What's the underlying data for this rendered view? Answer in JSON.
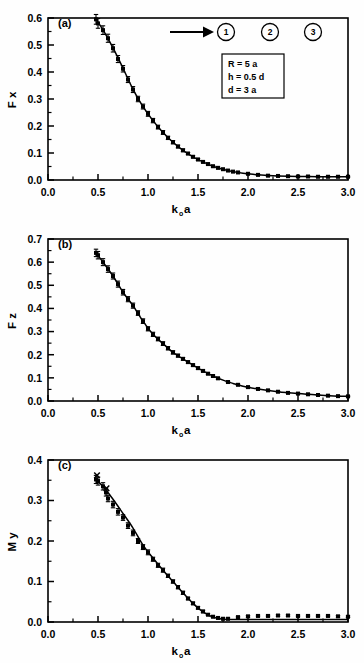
{
  "figure": {
    "background_color": "#fefefe",
    "line_color": "#000000",
    "marker_color": "#000000"
  },
  "annotations": {
    "arrow_label": "incident-arrow",
    "circled_numbers": [
      "1",
      "2",
      "3"
    ],
    "param_box": {
      "lines": [
        "R = 5 a",
        "h = 0.5 d",
        "d = 3 a"
      ]
    }
  },
  "axis_common": {
    "xlabel_main": "k",
    "xlabel_sub": "o",
    "xlabel_tail": "a",
    "xticks": [
      "0.0",
      "0.5",
      "1.0",
      "1.5",
      "2.0",
      "2.5",
      "3.0"
    ],
    "xlim": [
      0.0,
      3.0
    ]
  },
  "chart_data": [
    {
      "type": "scatter",
      "panel": "(a)",
      "title": "",
      "xlabel": "k o a",
      "ylabel": "F x",
      "xlim": [
        0.0,
        3.0
      ],
      "ylim": [
        0.0,
        0.6
      ],
      "xticks": [
        "0.0",
        "0.5",
        "1.0",
        "1.5",
        "2.0",
        "2.5",
        "3.0"
      ],
      "yticks": [
        "0.0",
        "0.1",
        "0.2",
        "0.3",
        "0.4",
        "0.5",
        "0.6"
      ],
      "grid": false,
      "legend": "none",
      "x": [
        0.48,
        0.5,
        0.55,
        0.6,
        0.65,
        0.7,
        0.75,
        0.8,
        0.85,
        0.9,
        0.95,
        1.0,
        1.05,
        1.1,
        1.15,
        1.2,
        1.25,
        1.3,
        1.35,
        1.4,
        1.45,
        1.5,
        1.55,
        1.6,
        1.65,
        1.7,
        1.75,
        1.8,
        1.85,
        1.9,
        2.0,
        2.1,
        2.2,
        2.3,
        2.4,
        2.5,
        2.6,
        2.7,
        2.8,
        2.9,
        3.0
      ],
      "y": [
        0.595,
        0.58,
        0.555,
        0.525,
        0.488,
        0.448,
        0.412,
        0.372,
        0.335,
        0.3,
        0.272,
        0.245,
        0.22,
        0.196,
        0.176,
        0.156,
        0.14,
        0.124,
        0.11,
        0.098,
        0.086,
        0.076,
        0.067,
        0.059,
        0.051,
        0.045,
        0.04,
        0.035,
        0.031,
        0.028,
        0.023,
        0.019,
        0.016,
        0.015,
        0.014,
        0.013,
        0.013,
        0.012,
        0.012,
        0.012,
        0.012
      ],
      "yerr": [
        0.018,
        0.018,
        0.016,
        0.015,
        0.014,
        0.013,
        0.012,
        0.011,
        0.011,
        0.01,
        0.009,
        0.009,
        0.008,
        0.007,
        0.007,
        0.006,
        0.006,
        0.005,
        0.005,
        0.004,
        0.004,
        0.004,
        0.003,
        0.003,
        0.003,
        0.003,
        0.002,
        0.002,
        0.002,
        0.002,
        0.002,
        0.002,
        0.002,
        0.002,
        0.002,
        0.002,
        0.002,
        0.002,
        0.002,
        0.002,
        0.002
      ],
      "line_x": [
        0.47,
        0.55,
        0.65,
        0.75,
        0.85,
        0.95,
        1.05,
        1.15,
        1.25,
        1.35,
        1.45,
        1.55,
        1.65,
        1.75,
        1.85,
        1.95,
        2.05,
        2.2,
        2.4,
        2.6,
        2.8,
        3.0
      ],
      "line_y": [
        0.6,
        0.556,
        0.489,
        0.414,
        0.336,
        0.272,
        0.22,
        0.176,
        0.14,
        0.11,
        0.086,
        0.067,
        0.051,
        0.04,
        0.031,
        0.025,
        0.021,
        0.017,
        0.014,
        0.013,
        0.012,
        0.012
      ]
    },
    {
      "type": "scatter",
      "panel": "(b)",
      "title": "",
      "xlabel": "k o a",
      "ylabel": "F z",
      "xlim": [
        0.0,
        3.0
      ],
      "ylim": [
        0.0,
        0.7
      ],
      "xticks": [
        "0.0",
        "0.5",
        "1.0",
        "1.5",
        "2.0",
        "2.5",
        "3.0"
      ],
      "yticks": [
        "0.0",
        "0.1",
        "0.2",
        "0.3",
        "0.4",
        "0.5",
        "0.6",
        "0.7"
      ],
      "grid": false,
      "legend": "none",
      "x": [
        0.48,
        0.5,
        0.55,
        0.6,
        0.65,
        0.7,
        0.75,
        0.8,
        0.85,
        0.9,
        0.95,
        1.0,
        1.05,
        1.1,
        1.15,
        1.2,
        1.25,
        1.3,
        1.35,
        1.4,
        1.45,
        1.5,
        1.55,
        1.6,
        1.65,
        1.7,
        1.8,
        1.9,
        2.0,
        2.1,
        2.2,
        2.3,
        2.4,
        2.5,
        2.6,
        2.7,
        2.8,
        2.9,
        3.0
      ],
      "y": [
        0.64,
        0.63,
        0.6,
        0.57,
        0.54,
        0.505,
        0.47,
        0.44,
        0.412,
        0.38,
        0.345,
        0.312,
        0.288,
        0.268,
        0.248,
        0.228,
        0.21,
        0.196,
        0.182,
        0.168,
        0.155,
        0.142,
        0.13,
        0.118,
        0.108,
        0.098,
        0.082,
        0.07,
        0.06,
        0.052,
        0.046,
        0.04,
        0.035,
        0.032,
        0.029,
        0.026,
        0.023,
        0.021,
        0.02
      ],
      "yerr": [
        0.016,
        0.016,
        0.015,
        0.014,
        0.013,
        0.013,
        0.012,
        0.011,
        0.011,
        0.01,
        0.01,
        0.009,
        0.009,
        0.008,
        0.008,
        0.007,
        0.007,
        0.006,
        0.006,
        0.005,
        0.005,
        0.005,
        0.004,
        0.004,
        0.004,
        0.004,
        0.003,
        0.003,
        0.003,
        0.003,
        0.002,
        0.002,
        0.002,
        0.002,
        0.002,
        0.002,
        0.002,
        0.002,
        0.002
      ],
      "line_x": [
        0.47,
        0.55,
        0.65,
        0.75,
        0.85,
        0.95,
        1.05,
        1.15,
        1.25,
        1.35,
        1.45,
        1.55,
        1.65,
        1.75,
        1.85,
        1.95,
        2.1,
        2.3,
        2.5,
        2.7,
        2.9,
        3.0
      ],
      "line_y": [
        0.645,
        0.6,
        0.54,
        0.47,
        0.412,
        0.345,
        0.288,
        0.248,
        0.21,
        0.182,
        0.155,
        0.13,
        0.108,
        0.09,
        0.076,
        0.064,
        0.052,
        0.04,
        0.032,
        0.026,
        0.021,
        0.02
      ]
    },
    {
      "type": "scatter",
      "panel": "(c)",
      "title": "",
      "xlabel": "k o a",
      "ylabel": "M y",
      "xlim": [
        0.0,
        3.0
      ],
      "ylim": [
        0.0,
        0.4
      ],
      "xticks": [
        "0.0",
        "0.5",
        "1.0",
        "1.5",
        "2.0",
        "2.5",
        "3.0"
      ],
      "yticks": [
        "0.0",
        "0.1",
        "0.2",
        "0.3",
        "0.4"
      ],
      "grid": false,
      "legend": "none",
      "x": [
        0.48,
        0.5,
        0.55,
        0.58,
        0.6,
        0.65,
        0.7,
        0.75,
        0.8,
        0.85,
        0.9,
        0.95,
        1.0,
        1.05,
        1.1,
        1.15,
        1.2,
        1.25,
        1.3,
        1.35,
        1.4,
        1.45,
        1.5,
        1.55,
        1.6,
        1.65,
        1.7,
        1.75,
        1.8,
        1.9,
        2.0,
        2.1,
        2.2,
        2.3,
        2.4,
        2.5,
        2.6,
        2.7,
        2.8,
        2.9,
        3.0
      ],
      "y": [
        0.352,
        0.348,
        0.335,
        0.32,
        0.305,
        0.29,
        0.272,
        0.258,
        0.238,
        0.22,
        0.2,
        0.185,
        0.172,
        0.155,
        0.14,
        0.128,
        0.114,
        0.1,
        0.086,
        0.072,
        0.058,
        0.046,
        0.035,
        0.026,
        0.018,
        0.013,
        0.01,
        0.008,
        0.008,
        0.012,
        0.014,
        0.015,
        0.015,
        0.016,
        0.016,
        0.015,
        0.015,
        0.015,
        0.015,
        0.014,
        0.013
      ],
      "yerr": [
        0.01,
        0.01,
        0.009,
        0.009,
        0.008,
        0.008,
        0.008,
        0.007,
        0.007,
        0.007,
        0.006,
        0.006,
        0.006,
        0.005,
        0.005,
        0.005,
        0.004,
        0.004,
        0.004,
        0.004,
        0.003,
        0.003,
        0.003,
        0.003,
        0.002,
        0.002,
        0.002,
        0.002,
        0.002,
        0.002,
        0.002,
        0.002,
        0.002,
        0.002,
        0.002,
        0.002,
        0.002,
        0.002,
        0.002,
        0.002,
        0.002
      ],
      "outliers_x": [
        0.49,
        0.585
      ],
      "outliers_y": [
        0.362,
        0.33
      ],
      "line_x": [
        0.47,
        0.55,
        0.65,
        0.75,
        0.85,
        0.95,
        1.05,
        1.15,
        1.25,
        1.35,
        1.45,
        1.55,
        1.65,
        1.75,
        1.85,
        2.0,
        2.2,
        2.5,
        2.8,
        3.0
      ],
      "line_y": [
        0.352,
        0.335,
        0.303,
        0.268,
        0.232,
        0.19,
        0.158,
        0.128,
        0.1,
        0.072,
        0.046,
        0.025,
        0.012,
        0.007,
        0.006,
        0.006,
        0.006,
        0.006,
        0.006,
        0.006
      ]
    }
  ]
}
